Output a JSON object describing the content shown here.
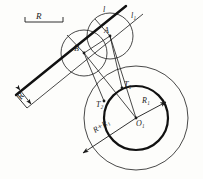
{
  "figure": {
    "background_color": "#fdfdfb",
    "ink_color": "#1a1a1a"
  },
  "labels": {
    "dim_R_top": "R",
    "dim_R_band": "R",
    "line_l": "l",
    "line_l1": "l₁",
    "point_A": "A",
    "point_B": "B",
    "point_T1": "T₁",
    "point_T2": "T₂",
    "radius_R1": "R₁",
    "radius_sum": "R+R₁",
    "center_O1": "O₁"
  },
  "geometry": {
    "main_circle": {
      "cx": 136,
      "cy": 118,
      "r": 32,
      "stroke_width": 2.1
    },
    "outer_circle": {
      "cx": 136,
      "cy": 118,
      "r": 52,
      "stroke_width": 0.8
    },
    "circle_A": {
      "cx": 110,
      "cy": 36,
      "r": 23,
      "stroke_width": 0.8
    },
    "circle_B": {
      "cx": 84,
      "cy": 53,
      "r": 23,
      "stroke_width": 0.8
    },
    "line_l": {
      "x1": 18,
      "y1": 93,
      "x2": 123,
      "y2": 8,
      "stroke_width": 2.2
    },
    "line_l1": {
      "x1": 28,
      "y1": 107,
      "x2": 141,
      "y2": 15,
      "stroke_width": 0.8
    },
    "band_edge": {
      "x1": 24,
      "y1": 101,
      "x2": 129,
      "y2": 16,
      "stroke_width": 0.8
    },
    "dim_bracket_top": {
      "x1": 25,
      "y1": 21,
      "x2": 63,
      "y2": 21
    },
    "arrow_R1": {
      "x1": 136,
      "y1": 118,
      "x2": 167,
      "y2": 101
    },
    "arrow_RplusR1": {
      "x1": 136,
      "y1": 118,
      "x2": 84,
      "y2": 152
    }
  }
}
